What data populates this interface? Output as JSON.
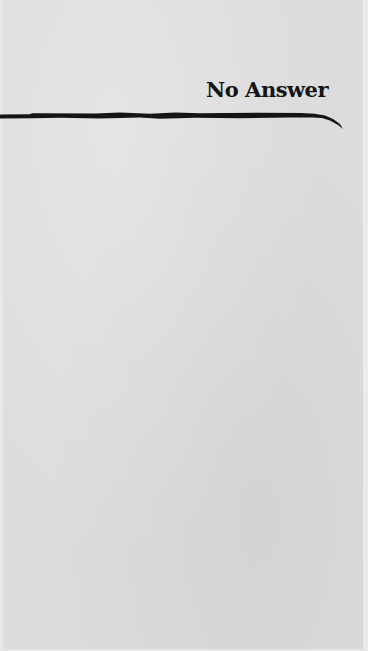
{
  "document": {
    "heading": "No Answer",
    "body_text": ""
  },
  "colors": {
    "paper": "#dcdcdc",
    "ink": "#141414"
  }
}
